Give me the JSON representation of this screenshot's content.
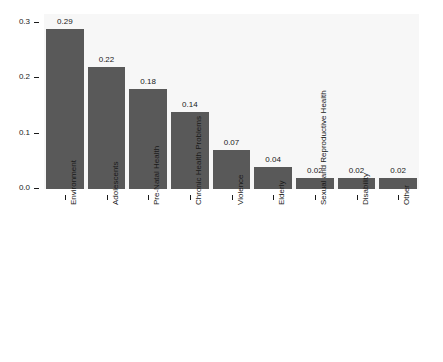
{
  "chart_data": {
    "type": "bar",
    "title": "",
    "subtitle": "",
    "xlabel": "",
    "ylabel": "",
    "ylim": [
      0.0,
      0.3
    ],
    "grid": false,
    "legend": "none",
    "y_ticks": [
      "0.0",
      "0.1",
      "0.2",
      "0.3"
    ],
    "y_tick_values": [
      0.0,
      0.1,
      0.2,
      0.3
    ],
    "categories": [
      "Environment",
      "Adolescents",
      "Pre-Natal Health",
      "Chronic Health Problems",
      "Violence",
      "Elderly",
      "Sexual and Reproductive Health",
      "Disability",
      "Other"
    ],
    "values": [
      0.29,
      0.22,
      0.18,
      0.14,
      0.07,
      0.04,
      0.02,
      0.02,
      0.02
    ],
    "value_labels": [
      "0.29",
      "0.22",
      "0.18",
      "0.14",
      "0.07",
      "0.04",
      "0.02",
      "0.02",
      "0.02"
    ],
    "bar_color": "#595959",
    "panel_color": "#f7f7f7",
    "text_color": "#1a1a1a"
  }
}
